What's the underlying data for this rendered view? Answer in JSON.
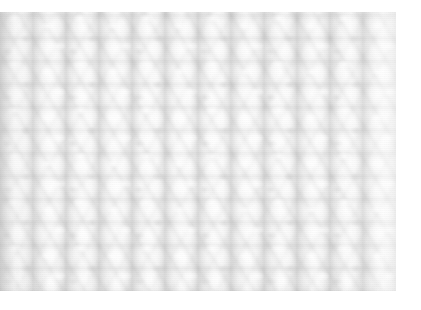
{
  "image": {
    "subject": "ribbed knit fabric close-up",
    "description": "Macro photograph of white cream-colored ribbed knitted wool fabric showing vertical columns of stitches",
    "palette": {
      "page_background": "#ffffff",
      "yarn_highlight": "#ffffff",
      "yarn_midtone": "#efefef",
      "shadow_channel": "#bcbcbc",
      "deep_shadow": "#a8a8a8",
      "edge_shade": "#9e9e9e"
    },
    "geometry": {
      "canvas_width": 421,
      "canvas_height": 310,
      "photo_left": 0,
      "photo_top": 12,
      "photo_width": 396,
      "photo_height": 279,
      "rib_column_pitch_px": 33,
      "stitch_course_pitch_px": 23,
      "rib_column_count": 12
    }
  }
}
